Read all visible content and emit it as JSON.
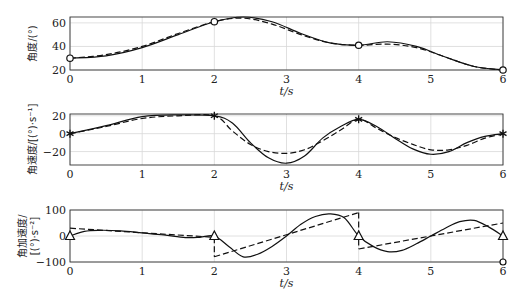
{
  "chart_data": [
    {
      "type": "line",
      "title": "",
      "xlabel": "t/s",
      "ylabel": "角度/(°)",
      "xlim": [
        0,
        6
      ],
      "ylim": [
        20,
        65
      ],
      "xticks": [
        "0",
        "1",
        "2",
        "3",
        "4",
        "5",
        "6"
      ],
      "yticks": [
        "20",
        "40",
        "60"
      ],
      "grid": true,
      "marker": "circle",
      "marker_points": [
        [
          0,
          30
        ],
        [
          2,
          61
        ],
        [
          4,
          41
        ],
        [
          6,
          20
        ]
      ],
      "x": [
        0,
        0.5,
        1,
        1.5,
        2,
        2.4,
        2.8,
        3.2,
        3.6,
        4,
        4.4,
        4.8,
        5.2,
        5.6,
        6
      ],
      "series": [
        {
          "name": "solid",
          "style": "solid",
          "values": [
            30,
            32,
            39,
            50,
            61,
            65,
            61,
            51,
            43,
            41,
            44,
            40,
            31,
            23,
            20
          ]
        },
        {
          "name": "dashed",
          "style": "dashed",
          "values": [
            30,
            33,
            40,
            51,
            61,
            64,
            59,
            50,
            43,
            41,
            42,
            39,
            31,
            23,
            20
          ]
        }
      ]
    },
    {
      "type": "line",
      "title": "",
      "xlabel": "t/s",
      "ylabel": "角速度/[(°)·s⁻¹]",
      "xlim": [
        0,
        6
      ],
      "ylim": [
        -35,
        22
      ],
      "xticks": [
        "0",
        "1",
        "2",
        "3",
        "4",
        "5",
        "6"
      ],
      "yticks": [
        "-20",
        "0",
        "20"
      ],
      "grid": true,
      "marker": "asterisk",
      "marker_points": [
        [
          0,
          0
        ],
        [
          2,
          20
        ],
        [
          4,
          16
        ],
        [
          6,
          0
        ]
      ],
      "x": [
        0,
        0.5,
        1,
        1.5,
        2,
        2.25,
        2.5,
        2.75,
        3,
        3.25,
        3.5,
        3.75,
        4,
        4.25,
        4.5,
        4.75,
        5,
        5.25,
        5.5,
        5.75,
        6
      ],
      "series": [
        {
          "name": "solid",
          "style": "solid",
          "values": [
            0,
            9,
            19,
            21,
            20,
            12,
            -10,
            -27,
            -33,
            -25,
            -5,
            8,
            16,
            8,
            -5,
            -17,
            -23,
            -20,
            -10,
            -3,
            0
          ]
        },
        {
          "name": "dashed",
          "style": "dashed",
          "values": [
            0,
            8,
            17,
            20,
            20,
            3,
            -12,
            -20,
            -22,
            -18,
            -8,
            4,
            16,
            6,
            -4,
            -12,
            -18,
            -18,
            -13,
            -5,
            0
          ]
        }
      ]
    },
    {
      "type": "line",
      "title": "",
      "xlabel": "t/s",
      "ylabel": "角加速度/[(°)·s⁻²]",
      "xlim": [
        0,
        6
      ],
      "ylim": [
        -100,
        100
      ],
      "xticks": [
        "0",
        "1",
        "2",
        "3",
        "4",
        "5",
        "6"
      ],
      "yticks": [
        "-100",
        "0",
        "100"
      ],
      "grid": true,
      "marker": "triangle",
      "marker_points": [
        [
          0,
          0
        ],
        [
          2,
          0
        ],
        [
          4,
          0
        ],
        [
          6,
          0
        ]
      ],
      "extra_marker": {
        "shape": "circle",
        "point": [
          6,
          -100
        ]
      },
      "x": [
        0,
        0.2,
        0.4,
        0.7,
        1,
        1.3,
        1.6,
        1.8,
        2,
        2.2,
        2.4,
        2.6,
        2.8,
        3,
        3.2,
        3.4,
        3.6,
        3.8,
        4,
        4.2,
        4.4,
        4.6,
        4.8,
        5,
        5.2,
        5.4,
        5.6,
        5.8,
        6
      ],
      "series": [
        {
          "name": "solid",
          "style": "solid",
          "values": [
            0,
            18,
            22,
            20,
            12,
            4,
            -6,
            -5,
            0,
            -40,
            -80,
            -70,
            -40,
            0,
            45,
            75,
            85,
            70,
            0,
            -40,
            -60,
            -55,
            -30,
            0,
            30,
            55,
            60,
            35,
            0
          ]
        },
        {
          "name": "dashed",
          "style": "dashed",
          "segments": [
            {
              "x": [
                0,
                2
              ],
              "values": [
                30,
                -5
              ]
            },
            {
              "x": [
                2,
                4
              ],
              "values": [
                -80,
                90
              ]
            },
            {
              "x": [
                4,
                6
              ],
              "values": [
                -50,
                50
              ]
            }
          ]
        }
      ]
    }
  ]
}
